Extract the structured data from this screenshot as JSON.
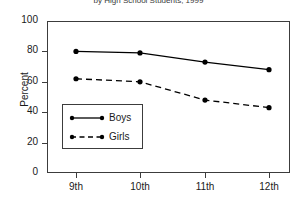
{
  "chart_data": {
    "type": "line",
    "title": "by High School Students, 1999",
    "title_truncated": true,
    "xlabel": "",
    "ylabel": "Percent",
    "categories": [
      "9th",
      "10th",
      "11th",
      "12th"
    ],
    "series": [
      {
        "name": "Boys",
        "values": [
          80,
          79,
          73,
          68
        ],
        "line_style": "solid",
        "marker": "filled-circle",
        "color": "#000000"
      },
      {
        "name": "Girls",
        "values": [
          62,
          60,
          48,
          43
        ],
        "line_style": "dashed",
        "marker": "filled-circle",
        "color": "#000000"
      }
    ],
    "ylim": [
      0,
      100
    ],
    "yticks": [
      0,
      20,
      40,
      60,
      80,
      100
    ],
    "grid": false,
    "legend_position": "lower-left-inside",
    "frame": true
  },
  "axes": {
    "y_label": "Percent",
    "y_ticks": [
      "100",
      "80",
      "60",
      "40",
      "20",
      "0"
    ],
    "x_ticks": [
      "9th",
      "10th",
      "11th",
      "12th"
    ]
  },
  "legend": {
    "entries": [
      {
        "label": "Boys"
      },
      {
        "label": "Girls"
      }
    ]
  }
}
